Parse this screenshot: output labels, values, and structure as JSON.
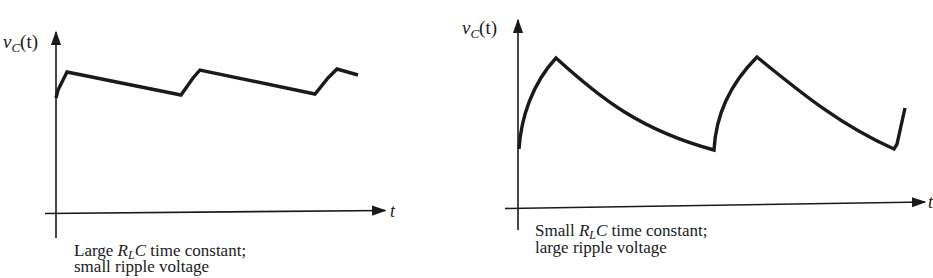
{
  "panels": [
    {
      "id": "large-time-constant",
      "y_axis_label": {
        "var": "v",
        "sub": "C",
        "arg": "(t)"
      },
      "x_axis_label": "t",
      "caption": {
        "line1_prefix": "Large ",
        "line1_symbol_R": "R",
        "line1_symbol_sub": "L",
        "line1_symbol_C": "C",
        "line1_suffix": " time constant;",
        "line2": "small ripple voltage"
      }
    },
    {
      "id": "small-time-constant",
      "y_axis_label": {
        "var": "v",
        "sub": "C",
        "arg": "(t)"
      },
      "x_axis_label": "t",
      "caption": {
        "line1_prefix": "Small ",
        "line1_symbol_R": "R",
        "line1_symbol_sub": "L",
        "line1_symbol_C": "C",
        "line1_suffix": " time constant;",
        "line2": "large ripple voltage"
      }
    }
  ],
  "colors": {
    "ink": "#1a1a1a",
    "background": "#ffffff"
  }
}
